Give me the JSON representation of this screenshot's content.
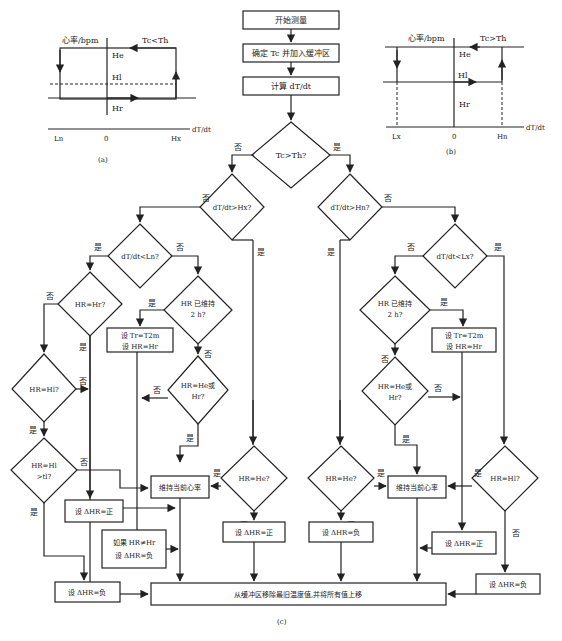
{
  "graph_a": {
    "y_label": "心率/bpm",
    "condition": "Tc<Th",
    "levels": [
      "He",
      "Hl",
      "Hr"
    ],
    "x_ticks": [
      "Ln",
      "0",
      "Hx"
    ],
    "x_label": "dT/dt",
    "caption": "(a)"
  },
  "graph_b": {
    "y_label": "心率/bpm",
    "condition": "Tc>Th",
    "levels": [
      "He",
      "Hl",
      "Hr"
    ],
    "x_ticks": [
      "Lx",
      "0",
      "Hn"
    ],
    "x_label": "dT/dt",
    "caption": "(b)"
  },
  "flow": {
    "start": "开始测量",
    "step1": "确定 Tc 并加入缓冲区",
    "step2": "计算 dT/dt",
    "d_main": "Tc>Th?",
    "d_left": "dT/dt>Hx?",
    "d_right": "dT/dt>Hn?",
    "d_ll": "dT/dt<Ln?",
    "d_rr": "dT/dt<Lx?",
    "d_hr_hr": "HR=Hr?",
    "d_hold_l1": "HR 已维持",
    "d_hold_l2": "2 h?",
    "set_t_l1": "设 Tr=T2m",
    "set_t_l2": "设 HR=Hr",
    "d_hr_hl": "HR=Hl?",
    "d_hr_he_or_l1": "HR=He或",
    "d_hr_he_or_l2": "Hr?",
    "d_hr_hl_t1": "HR=Hl",
    "d_hr_hl_t2": ">tl?",
    "keep": "维持当前心率",
    "d_hr_he": "HR=He?",
    "d_hr_hl_r": "HR=Hl?",
    "pos": "设 ΔHR=正",
    "neg": "设 ΔHR=负",
    "if_ne_l1": "如果 HR≠Hr",
    "if_ne_l2": "设 ΔHR=负",
    "final": "从缓冲区移除最旧温度值,并将所有值上移",
    "yes": "是",
    "no": "否",
    "caption": "(c)"
  }
}
